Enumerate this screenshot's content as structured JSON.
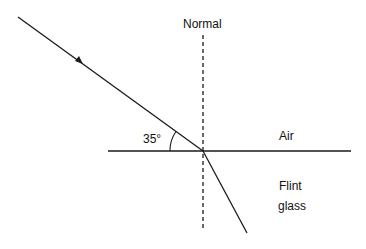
{
  "diagram": {
    "labels": {
      "normal": "Normal",
      "angle": "35°",
      "medium_top": "Air",
      "medium_bottom_line1": "Flint",
      "medium_bottom_line2": "glass"
    },
    "geometry": {
      "intersection": [
        203,
        151
      ],
      "incident_start": [
        18,
        17
      ],
      "refracted_end": [
        247,
        233
      ],
      "boundary": {
        "x1": 108,
        "x2": 351,
        "y": 151
      },
      "normal": {
        "x": 203,
        "y1": 35,
        "y2": 231
      },
      "angle_between_ray_and_boundary_deg": 35
    },
    "colors": {
      "line": "#1a1a1a",
      "background": "#ffffff"
    }
  }
}
